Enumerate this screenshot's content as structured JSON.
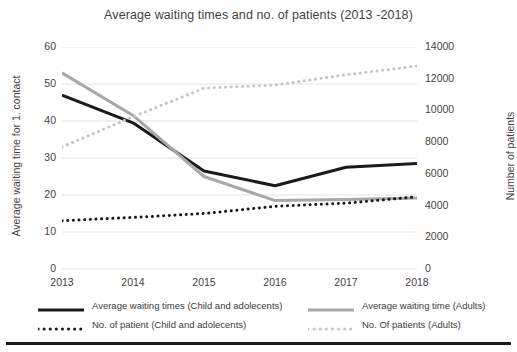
{
  "chart_data": {
    "type": "line",
    "title": "Average waiting times and no. of patients (2013 -2018)",
    "categories": [
      "2013",
      "2014",
      "2015",
      "2016",
      "2017",
      "2018"
    ],
    "x": [
      2013,
      2014,
      2015,
      2016,
      2017,
      2018
    ],
    "xlabel": "",
    "ylabel": "Average waiting time for 1. contact",
    "y2label": "Number of patients",
    "ylim": [
      0,
      60
    ],
    "y2lim": [
      0,
      14000
    ],
    "ytick_labels": [
      "0",
      "10",
      "20",
      "30",
      "40",
      "50",
      "60"
    ],
    "ytick_values": [
      0,
      10,
      20,
      30,
      40,
      50,
      60
    ],
    "y2tick_labels": [
      "0",
      "2000",
      "4000",
      "6000",
      "8000",
      "10000",
      "12000",
      "14000"
    ],
    "y2tick_values": [
      0,
      2000,
      4000,
      6000,
      8000,
      10000,
      12000,
      14000
    ],
    "grid": true,
    "legend_position": "bottom",
    "series": [
      {
        "name": "Average waiting times (Child and adolecents)",
        "axis": "left",
        "style": "solid",
        "color": "#1a1a1a",
        "width": 3,
        "values": [
          47,
          39.5,
          26.5,
          22.5,
          27.5,
          28.5
        ]
      },
      {
        "name": "Average waiting time (Adults)",
        "axis": "left",
        "style": "solid",
        "color": "#a8a8a8",
        "width": 3,
        "values": [
          53,
          41.5,
          25,
          18.5,
          18.8,
          19.2
        ]
      },
      {
        "name": "No. of patient  (Child and adolecents)",
        "axis": "right",
        "style": "dotted",
        "color": "#1a1a1a",
        "width": 3,
        "values": [
          3050,
          3250,
          3500,
          3950,
          4150,
          4550
        ]
      },
      {
        "name": "No. Of patients (Adults)",
        "axis": "right",
        "style": "dotted",
        "color": "#c4c4c4",
        "width": 3,
        "values": [
          7700,
          9600,
          11400,
          11600,
          12250,
          12800
        ]
      }
    ]
  },
  "legend": [
    {
      "label": "Average waiting times (Child and adolecents)",
      "color": "#1a1a1a",
      "style": "solid"
    },
    {
      "label": "Average waiting time (Adults)",
      "color": "#a8a8a8",
      "style": "solid"
    },
    {
      "label": "No. of patient  (Child and adolecents)",
      "color": "#1a1a1a",
      "style": "dotted"
    },
    {
      "label": "No. Of patients (Adults)",
      "color": "#c4c4c4",
      "style": "dotted"
    }
  ]
}
